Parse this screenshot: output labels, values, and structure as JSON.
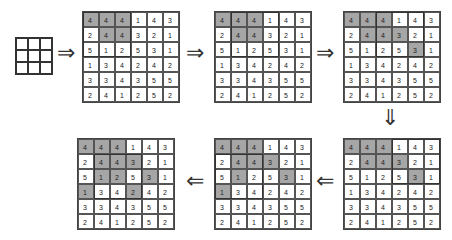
{
  "diagram": {
    "title": "",
    "kernel": {
      "rows": 3,
      "cols": 3
    },
    "matrix": [
      [
        "4",
        "4",
        "4",
        "1",
        "4",
        "3"
      ],
      [
        "2",
        "4",
        "4",
        "3",
        "2",
        "1"
      ],
      [
        "5",
        "1",
        "2",
        "5",
        "3",
        "1"
      ],
      [
        "1",
        "3",
        "4",
        "2",
        "4",
        "2"
      ],
      [
        "3",
        "3",
        "4",
        "3",
        "5",
        "5"
      ],
      [
        "2",
        "4",
        "1",
        "2",
        "5",
        "2"
      ]
    ],
    "steps": [
      {
        "position": "top-1",
        "shaded": [
          [
            0,
            0
          ],
          [
            0,
            1
          ],
          [
            0,
            2
          ],
          [
            1,
            1
          ],
          [
            1,
            2
          ]
        ],
        "window": [
          0,
          0
        ]
      },
      {
        "position": "top-2",
        "shaded": [
          [
            0,
            0
          ],
          [
            0,
            1
          ],
          [
            0,
            2
          ],
          [
            1,
            1
          ],
          [
            1,
            2
          ]
        ],
        "window": [
          0,
          1
        ]
      },
      {
        "position": "top-3",
        "shaded": [
          [
            0,
            0
          ],
          [
            0,
            1
          ],
          [
            0,
            2
          ],
          [
            1,
            1
          ],
          [
            1,
            2
          ],
          [
            1,
            3
          ],
          [
            2,
            4
          ]
        ],
        "window": [
          0,
          2
        ]
      },
      {
        "position": "bottom-right",
        "shaded": [
          [
            0,
            0
          ],
          [
            0,
            1
          ],
          [
            0,
            2
          ],
          [
            1,
            1
          ],
          [
            1,
            2
          ],
          [
            1,
            3
          ],
          [
            2,
            4
          ]
        ],
        "window": [
          0,
          3
        ]
      },
      {
        "position": "bottom-middle",
        "shaded": [
          [
            0,
            0
          ],
          [
            0,
            1
          ],
          [
            0,
            2
          ],
          [
            1,
            1
          ],
          [
            1,
            2
          ],
          [
            1,
            3
          ],
          [
            2,
            1
          ],
          [
            2,
            4
          ],
          [
            3,
            0
          ]
        ],
        "window": [
          1,
          0
        ]
      },
      {
        "position": "bottom-left",
        "shaded": [
          [
            0,
            0
          ],
          [
            0,
            1
          ],
          [
            0,
            2
          ],
          [
            1,
            1
          ],
          [
            1,
            2
          ],
          [
            1,
            3
          ],
          [
            2,
            1
          ],
          [
            2,
            2
          ],
          [
            2,
            4
          ],
          [
            3,
            0
          ],
          [
            3,
            3
          ]
        ],
        "window": [
          1,
          1
        ]
      }
    ],
    "arrows": [
      {
        "glyph": "⇒",
        "x": 57,
        "y": 42
      },
      {
        "glyph": "⇒",
        "x": 186,
        "y": 42
      },
      {
        "glyph": "⇒",
        "x": 316,
        "y": 42
      },
      {
        "glyph": "⇓",
        "x": 381,
        "y": 107
      },
      {
        "glyph": "⇐",
        "x": 316,
        "y": 170
      },
      {
        "glyph": "⇐",
        "x": 186,
        "y": 170
      }
    ],
    "colors": {
      "shade": "#a6a6a6",
      "grid_line": "#555555",
      "text": "#222222"
    }
  }
}
